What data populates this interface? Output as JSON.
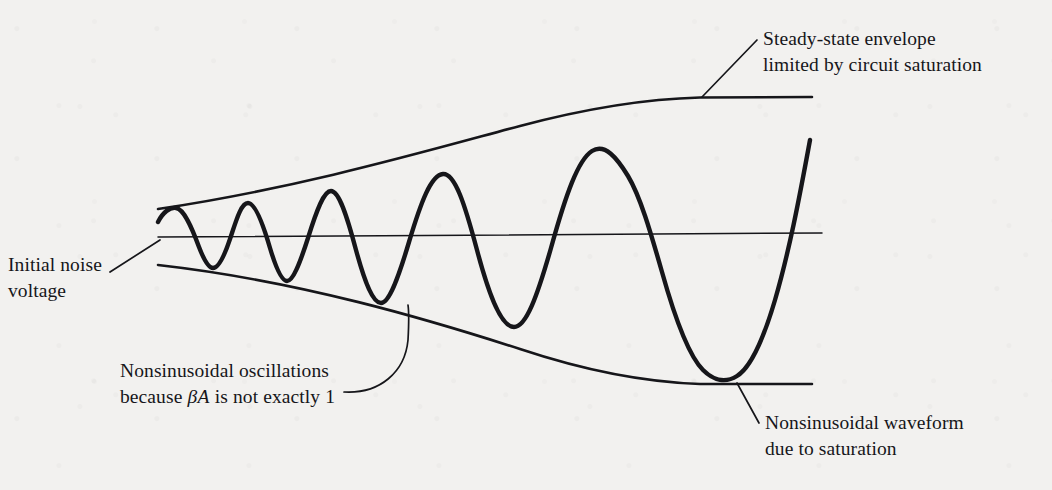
{
  "figure": {
    "background_color": "#f2f1ef",
    "ink_color": "#16161a"
  },
  "labels": {
    "steady_state": {
      "line1": "Steady-state envelope",
      "line2": "limited by circuit saturation"
    },
    "initial_noise": {
      "line1": "Initial noise",
      "line2": "voltage"
    },
    "nonsinusoidal_oscillations": {
      "line1": "Nonsinusoidal oscillations",
      "line2_prefix": "because ",
      "line2_math": "βA",
      "line2_suffix": " is not exactly 1"
    },
    "nonsinusoidal_waveform": {
      "line1": "Nonsinusoidal waveform",
      "line2": "due to saturation"
    }
  },
  "chart_data": {
    "type": "line",
    "xlabel": "",
    "ylabel": "",
    "grid": false,
    "legend": null,
    "xlim": [
      158,
      822
    ],
    "ylim": [
      98,
      384
    ],
    "annotations": [
      "Steady-state envelope limited by circuit saturation",
      "Initial noise voltage",
      "Nonsinusoidal oscillations because βA is not exactly 1",
      "Nonsinusoidal waveform due to saturation"
    ],
    "series": [
      {
        "name": "zero-axis",
        "style": "thin-line",
        "path": "M 158 237 L 822 233"
      },
      {
        "name": "upper-envelope",
        "style": "medium-line",
        "path": "M 158 209 C 300 188, 430 150, 520 126 C 580 110, 640 99, 700 97.5 L 812 97"
      },
      {
        "name": "lower-envelope",
        "style": "medium-line",
        "path": "M 158 265 C 300 281, 430 320, 520 349 C 580 369, 640 382, 700 384 L 812 384"
      },
      {
        "name": "oscillation-waveform",
        "style": "thick-line",
        "path": "M 158 222 C 163 212, 170 207, 176 208 C 184 209, 192 228, 199 247 C 204 260, 209 268, 213 268 C 218 268, 224 257, 230 239 C 236 221, 241 203, 248 203 C 255 203, 263 224, 270 248 C 276 268, 282 281, 287 281 C 293 281, 300 263, 308 238 C 317 209, 324 191, 331 191 C 339 191, 347 216, 356 250 C 365 283, 373 303, 381 303 C 389 303, 398 279, 409 242 C 421 202, 431 175, 443 174 C 455 173, 465 205, 477 250 C 490 299, 502 327, 514 327 C 526 327, 537 297, 551 248 C 566 194, 578 160, 592 151 C 605 143, 617 158, 628 176 C 640 196, 650 230, 662 272 C 676 322, 689 356, 703 370 C 714 381, 726 383, 737 376 C 750 368, 762 344, 775 300 C 789 252, 799 200, 810 140"
      }
    ],
    "leaders": [
      {
        "name": "steady-state-leader",
        "path": "M 757 40 L 702 97"
      },
      {
        "name": "initial-noise-leader",
        "path": "M 110 272 L 160 240"
      },
      {
        "name": "nonsinusoidal-osc-leader",
        "path": "M 344 392 C 380 394, 405 372, 408 340 C 409 322, 409 312, 408 305"
      },
      {
        "name": "nonsinusoidal-wave-leader",
        "path": "M 759 423 L 737 383"
      }
    ],
    "markers": {
      "peaks_x": [
        176,
        248,
        331,
        443,
        592
      ],
      "troughs_x": [
        213,
        287,
        381,
        514,
        703
      ],
      "note": "amplitude and period both increase until the waveform clips against the steady-state envelope"
    }
  }
}
